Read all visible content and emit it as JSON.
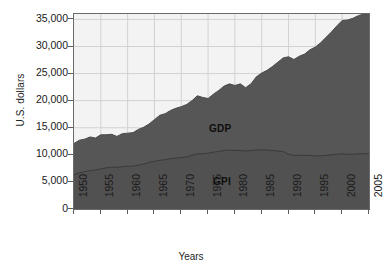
{
  "chart_data": {
    "type": "area",
    "title": "",
    "subtitle": "",
    "xlabel": "Years",
    "ylabel": "U.S. dollars",
    "xlim": [
      1950,
      2005
    ],
    "ylim": [
      0,
      36000
    ],
    "grid": true,
    "legend_position": "inline-annotations",
    "annotations": [
      {
        "text": "GDP",
        "x": 1977,
        "y": 14500
      },
      {
        "text": "GPI",
        "x": 1977,
        "y": 4900
      }
    ],
    "y_ticks": [
      0,
      5000,
      10000,
      15000,
      20000,
      25000,
      30000,
      35000
    ],
    "y_tick_labels": [
      "0",
      "5,000",
      "10,000",
      "15,000",
      "20,000",
      "25,000",
      "30,000",
      "35,000"
    ],
    "x_ticks": [
      1950,
      1955,
      1960,
      1965,
      1970,
      1975,
      1980,
      1985,
      1990,
      1995,
      2000,
      2005
    ],
    "x_tick_labels": [
      "1950",
      "1955",
      "1960",
      "1965",
      "1970",
      "1975",
      "1980",
      "1985",
      "1990",
      "1995",
      "2000",
      "2005"
    ],
    "x": [
      1950,
      1951,
      1952,
      1953,
      1954,
      1955,
      1956,
      1957,
      1958,
      1959,
      1960,
      1961,
      1962,
      1963,
      1964,
      1965,
      1966,
      1967,
      1968,
      1969,
      1970,
      1971,
      1972,
      1973,
      1974,
      1975,
      1976,
      1977,
      1978,
      1979,
      1980,
      1981,
      1982,
      1983,
      1984,
      1985,
      1986,
      1987,
      1988,
      1989,
      1990,
      1991,
      1992,
      1993,
      1994,
      1995,
      1996,
      1997,
      1998,
      1999,
      2000,
      2001,
      2002,
      2003,
      2004
    ],
    "series": [
      {
        "name": "GDP",
        "color": "#565656",
        "values": [
          12100,
          12700,
          12900,
          13300,
          13100,
          13700,
          13700,
          13800,
          13400,
          13900,
          14000,
          14100,
          14700,
          15100,
          15700,
          16500,
          17300,
          17600,
          18200,
          18600,
          18900,
          19300,
          20000,
          20900,
          20600,
          20400,
          21200,
          21900,
          22700,
          23100,
          22800,
          23100,
          22400,
          23100,
          24400,
          25100,
          25600,
          26300,
          27100,
          27900,
          28100,
          27600,
          28200,
          28600,
          29400,
          29900,
          30700,
          31700,
          32700,
          33800,
          34800,
          34900,
          35200,
          35700,
          36000
        ]
      },
      {
        "name": "GPI",
        "color": "#3e3e3e",
        "values": [
          6300,
          6700,
          6900,
          7100,
          7200,
          7400,
          7600,
          7700,
          7700,
          7800,
          7900,
          7900,
          8100,
          8300,
          8600,
          8800,
          9000,
          9100,
          9300,
          9400,
          9500,
          9600,
          9900,
          10200,
          10200,
          10300,
          10500,
          10600,
          10800,
          10900,
          10800,
          10800,
          10700,
          10800,
          10900,
          10900,
          10900,
          10800,
          10700,
          10600,
          10100,
          9900,
          9900,
          9900,
          9900,
          9800,
          9800,
          9900,
          10000,
          10100,
          10200,
          10100,
          10100,
          10200,
          10200
        ]
      }
    ]
  },
  "axes": {
    "y_title": "U.S. dollars",
    "x_title": "Years"
  }
}
